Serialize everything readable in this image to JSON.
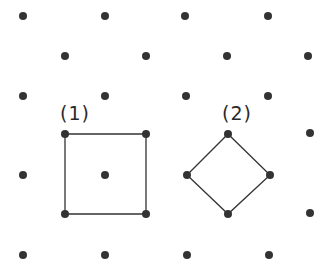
{
  "diagram": {
    "dot_color": "#333333",
    "line_color": "#333333",
    "dot_radius": 4,
    "dots": [
      [
        23,
        16
      ],
      [
        105,
        16
      ],
      [
        185,
        16
      ],
      [
        268,
        16
      ],
      [
        65,
        56
      ],
      [
        146,
        56
      ],
      [
        227,
        56
      ],
      [
        308,
        56
      ],
      [
        23,
        96
      ],
      [
        105,
        96
      ],
      [
        186,
        96
      ],
      [
        268,
        96
      ],
      [
        65,
        134
      ],
      [
        146,
        134
      ],
      [
        228,
        134
      ],
      [
        310,
        133
      ],
      [
        23,
        175
      ],
      [
        105,
        175
      ],
      [
        187,
        175
      ],
      [
        270,
        175
      ],
      [
        65,
        214
      ],
      [
        146,
        214
      ],
      [
        228,
        214
      ],
      [
        310,
        213
      ],
      [
        23,
        255
      ],
      [
        105,
        255
      ],
      [
        187,
        255
      ],
      [
        269,
        255
      ]
    ],
    "shapes": [
      {
        "name": "square-1",
        "label": "(1)",
        "points": [
          [
            65,
            134
          ],
          [
            146,
            134
          ],
          [
            146,
            214
          ],
          [
            65,
            214
          ]
        ],
        "label_pos": [
          60,
          102
        ]
      },
      {
        "name": "square-2",
        "label": "(2)",
        "points": [
          [
            228,
            134
          ],
          [
            270,
            175
          ],
          [
            228,
            214
          ],
          [
            187,
            175
          ]
        ],
        "label_pos": [
          222,
          102
        ]
      }
    ]
  }
}
